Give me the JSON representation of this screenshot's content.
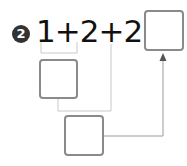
{
  "problem": {
    "number": "2",
    "expression": "1+2+2=",
    "answer_box": "",
    "intermediate_box": "",
    "second_step_box": ""
  },
  "colors": {
    "badge_bg": "#333333",
    "box_border": "#8a8a8a",
    "line": "#c8c8c8",
    "arrow": "#555555"
  }
}
